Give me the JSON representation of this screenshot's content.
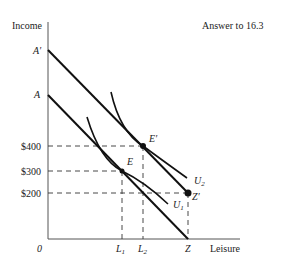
{
  "title": "Answer to 16.3",
  "axes": {
    "y_label": "Income",
    "x_label": "Leisure",
    "origin": "0"
  },
  "y_ticks": {
    "A_prime": "A′",
    "A": "A",
    "v400": "$400",
    "v300": "$300",
    "v200": "$200"
  },
  "x_ticks": {
    "L1": "L",
    "L1_sub": "1",
    "L2": "L",
    "L2_sub": "2",
    "Z": "Z"
  },
  "points": {
    "E": "E",
    "E_prime": "E′",
    "Z_prime": "Z′"
  },
  "curves": {
    "U1": "U",
    "U1_sub": "1",
    "U2": "U",
    "U2_sub": "2"
  },
  "colors": {
    "line": "#111111",
    "axis": "#555555",
    "text": "#222222"
  }
}
